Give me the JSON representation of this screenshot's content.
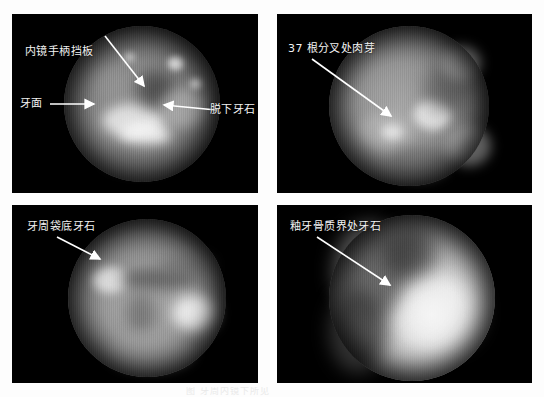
{
  "figure": {
    "background_color": "#ffffff",
    "panel_background": "#000000",
    "label_color": "#f2f2f2",
    "arrow_color": "#ffffff",
    "grid": {
      "rows": 2,
      "cols": 2
    },
    "bottom_caption": "图 牙周内镜下所见"
  },
  "panels": [
    {
      "id": "panel-1",
      "position": "top-left",
      "labels": [
        {
          "name": "label-endoscope-handle-baffle",
          "text": "内镜手柄挡板"
        },
        {
          "name": "label-tooth-surface",
          "text": "牙面"
        },
        {
          "name": "label-detached-calculus",
          "text": "脱下牙石"
        }
      ]
    },
    {
      "id": "panel-2",
      "position": "top-right",
      "labels": [
        {
          "name": "label-furcation-granulation",
          "text": "37 根分叉处肉芽"
        }
      ]
    },
    {
      "id": "panel-3",
      "position": "bottom-left",
      "labels": [
        {
          "name": "label-pocket-base-calculus",
          "text": "牙周袋底牙石"
        }
      ]
    },
    {
      "id": "panel-4",
      "position": "bottom-right",
      "labels": [
        {
          "name": "label-cej-calculus",
          "text": "釉牙骨质界处牙石"
        }
      ]
    }
  ]
}
